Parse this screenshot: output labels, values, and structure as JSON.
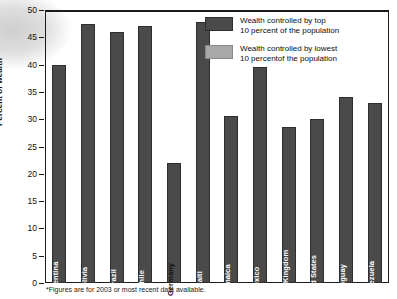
{
  "chart_data": {
    "type": "bar",
    "title": "",
    "xlabel": "",
    "ylabel": "Percent of wealth",
    "ylim": [
      0,
      50
    ],
    "ytick_step": 5,
    "yticks": [
      "50",
      "45",
      "40",
      "35",
      "30",
      "25",
      "20",
      "15",
      "10",
      "5",
      "0"
    ],
    "grid": false,
    "legend_position": "top-right",
    "categories": [
      "Argentina",
      "Bolivia",
      "Brazil",
      "Chile",
      "Germany",
      "Haiti",
      "Jamaica",
      "Mexico",
      "United Kingdom",
      "United States",
      "Uruguay",
      "Venezuela"
    ],
    "series": [
      {
        "name": "Wealth controlled by top 10 percent of the population",
        "color": "#4a4a4a",
        "values": [
          40.0,
          47.5,
          46.0,
          47.0,
          22.0,
          47.8,
          30.5,
          39.5,
          28.5,
          30.0,
          34.0,
          33.0
        ]
      },
      {
        "name": "Wealth controlled by lowest 10 percentof the population",
        "color": "#a8a8a8",
        "values": [
          1.0,
          0.5,
          0.7,
          1.2,
          3.0,
          0.7,
          2.1,
          1.0,
          2.1,
          1.8,
          1.8,
          0.9
        ]
      }
    ],
    "footnote": "*Figures are for 2003 or most recent data available."
  },
  "legend": {
    "items": [
      {
        "label": "Wealth controlled by top\n10 percent of the population",
        "line1": "Wealth controlled by top",
        "line2": "10 percent of the population"
      },
      {
        "label": "Wealth controlled by lowest\n10 percentof the population",
        "line1": "Wealth controlled by lowest",
        "line2": "10 percentof the population"
      }
    ]
  }
}
